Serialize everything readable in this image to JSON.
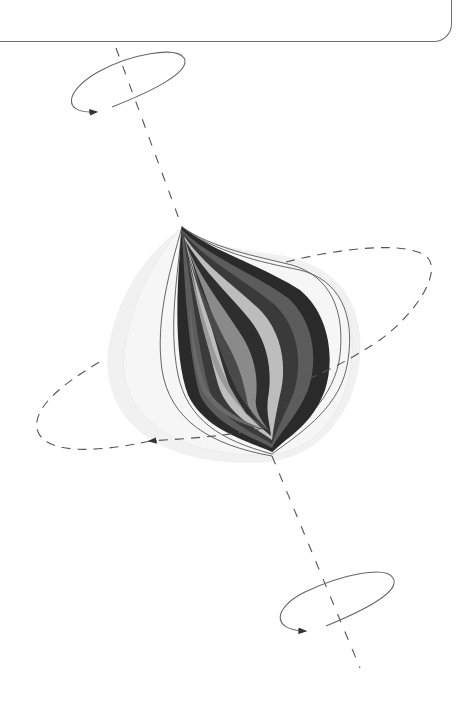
{
  "caption": {
    "text": "",
    "note": ""
  },
  "diagram": {
    "axis": {
      "style": "dashed",
      "color": "#555555"
    },
    "rotation_arrows": [
      {
        "id": "top",
        "style": "solid"
      },
      {
        "id": "middle",
        "style": "dashed"
      },
      {
        "id": "bottom",
        "style": "solid"
      }
    ],
    "layer_colors": [
      "#2a2a2a",
      "#5c5c5c",
      "#7a7a7a",
      "#9a9a9a",
      "#bdbdbd",
      "#3a3a3a",
      "#8a8a8a"
    ],
    "outline_color": "#555555",
    "halo_color": "#eeeeee"
  }
}
